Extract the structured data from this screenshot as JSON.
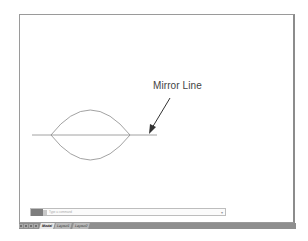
{
  "canvas": {
    "annotation": "Mirror Line",
    "colors": {
      "geometry": "#8a8a8a",
      "arrow": "#333333",
      "border": "#9a9a9a",
      "statusbar": "#8e8e8e"
    }
  },
  "command_line": {
    "placeholder": "Type a command",
    "dropdown_glyph": "▾"
  },
  "layout_tabs": [
    {
      "label": "Model",
      "active": true
    },
    {
      "label": "Layout1",
      "active": false
    },
    {
      "label": "Layout2",
      "active": false
    }
  ]
}
